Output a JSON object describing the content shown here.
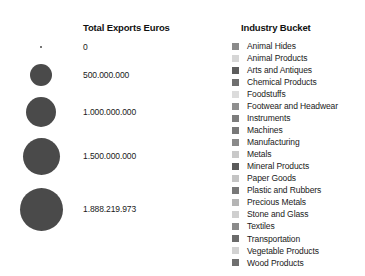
{
  "chart_data": {
    "type": "table",
    "title": "",
    "size_legend": {
      "title": "Total Exports Euros",
      "field": "Total Exports Euros",
      "unit": "Euros",
      "number_format": "european-dot-thousands",
      "entries": [
        {
          "label": "0",
          "value": 0,
          "diameter_px": 2,
          "center_x": 41,
          "center_y": 47
        },
        {
          "label": "500.000.000",
          "value": 500000000,
          "diameter_px": 22,
          "center_x": 41,
          "center_y": 75
        },
        {
          "label": "1.000.000.000",
          "value": 1000000000,
          "diameter_px": 30,
          "center_x": 41,
          "center_y": 112
        },
        {
          "label": "1.500.000.000",
          "value": 1500000000,
          "diameter_px": 37,
          "center_x": 41,
          "center_y": 156
        },
        {
          "label": "1.888.219.973",
          "value": 1888219973,
          "diameter_px": 43,
          "center_x": 41,
          "center_y": 209
        }
      ]
    },
    "color_legend": {
      "title": "Industry Bucket",
      "field": "Industry Bucket",
      "position": "right",
      "entries": [
        {
          "label": "Animal Hides",
          "color": "#8a8a8a"
        },
        {
          "label": "Animal Products",
          "color": "#d6d6d6"
        },
        {
          "label": "Arts and Antiques",
          "color": "#5d5d5d"
        },
        {
          "label": "Chemical Products",
          "color": "#6f6f6f"
        },
        {
          "label": "Foodstuffs",
          "color": "#dcdcdc"
        },
        {
          "label": "Footwear and Headwear",
          "color": "#8f8f8f"
        },
        {
          "label": "Instruments",
          "color": "#7d7d7d"
        },
        {
          "label": "Machines",
          "color": "#787878"
        },
        {
          "label": "Manufacturing",
          "color": "#8a8a8a"
        },
        {
          "label": "Metals",
          "color": "#c9c9c9"
        },
        {
          "label": "Mineral Products",
          "color": "#5a5a5a"
        },
        {
          "label": "Paper Goods",
          "color": "#c4c4c4"
        },
        {
          "label": "Plastic and Rubbers",
          "color": "#787878"
        },
        {
          "label": "Precious Metals",
          "color": "#b5b5b5"
        },
        {
          "label": "Stone and Glass",
          "color": "#cfcfcf"
        },
        {
          "label": "Textiles",
          "color": "#8a8a8a"
        },
        {
          "label": "Transportation",
          "color": "#6b6b6b"
        },
        {
          "label": "Vegetable Products",
          "color": "#d2d2d2"
        },
        {
          "label": "Wood Products",
          "color": "#6f6f6f"
        }
      ]
    },
    "colors": {
      "bubble_fill": "#4a4a4a",
      "text": "#1a1a1a",
      "title_text": "#111111",
      "background": "#ffffff"
    }
  }
}
